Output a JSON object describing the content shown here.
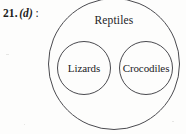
{
  "figure": {
    "question_label": {
      "number": "21.",
      "option": "(d)",
      "colon": ":"
    },
    "diagram": {
      "type": "euler-diagram",
      "outer_set_label": "Reptiles",
      "inner_sets": [
        {
          "label": "Lizards"
        },
        {
          "label": "Crocodiles"
        }
      ],
      "stroke_color": "#4a4a4f",
      "text_color": "#232326",
      "background_color": "#fdfdfc"
    }
  }
}
